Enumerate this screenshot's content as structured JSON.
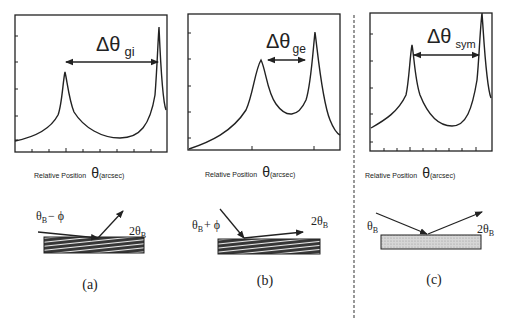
{
  "panels": [
    {
      "id": "a",
      "delta_symbol": "Δθ",
      "delta_subscript": "gi",
      "axis_label": "Relative Position",
      "axis_theta": "θ",
      "axis_unit": "(arcsec)",
      "incident_label": "θ",
      "incident_sub": "B",
      "incident_suffix": "− ϕ",
      "diffracted_label": "2θ",
      "diffracted_sub": "B",
      "caption": "(a)",
      "crystal_fill": "hatched"
    },
    {
      "id": "b",
      "delta_symbol": "Δθ",
      "delta_subscript": "ge",
      "axis_label": "Relative Position",
      "axis_theta": "θ",
      "axis_unit": "(arcsec)",
      "incident_label": "θ",
      "incident_sub": "B",
      "incident_suffix": "+ ϕ",
      "diffracted_label": "2θ",
      "diffracted_sub": "B",
      "caption": "(b)",
      "crystal_fill": "hatched"
    },
    {
      "id": "c",
      "delta_symbol": "Δθ",
      "delta_subscript": "sym",
      "axis_label": "Relative Position",
      "axis_theta": "θ",
      "axis_unit": "(arcsec)",
      "incident_label": "θ",
      "incident_sub": "B",
      "incident_suffix": "",
      "diffracted_label": "2θ",
      "diffracted_sub": "B",
      "caption": "(c)",
      "crystal_fill": "dotted"
    }
  ],
  "colors": {
    "ink": "#222222",
    "crystal_dark": "#3a3a3a",
    "crystal_dots": "#cfcfcf",
    "divider": "#555555"
  }
}
